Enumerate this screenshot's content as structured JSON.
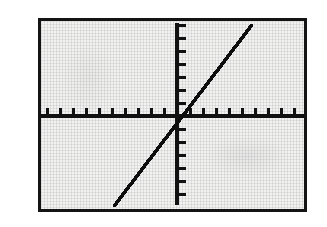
{
  "screen": {
    "device_label": "graphing-calculator-screen",
    "frame_color": "#141414",
    "lcd_background_color": "#f2f2f1",
    "ink_color": "#111111",
    "page_background_color": "#ffffff"
  },
  "chart_data": {
    "type": "line",
    "title": "",
    "subtitle": "",
    "xlabel": "",
    "ylabel": "",
    "grid": true,
    "legend": null,
    "legend_position": "none",
    "axes_style": "centered-crosshair-with-tick-marks",
    "tick_labels_visible": false,
    "x_tick_count_left_of_origin": 10,
    "x_tick_count_right_of_origin": 10,
    "y_tick_count_above_origin": 7,
    "y_tick_count_below_origin": 7,
    "xlim": [
      -10,
      10
    ],
    "ylim": [
      -7,
      7
    ],
    "x_tick_interval": 1,
    "y_tick_interval": 1,
    "origin": [
      0,
      0
    ],
    "series": [
      {
        "name": "y = x",
        "equation": "y = x",
        "slope": 1,
        "intercept": 0,
        "style": "solid",
        "x": [
          -5.2,
          -4,
          -3,
          -2,
          -1,
          0,
          1,
          2,
          3,
          4,
          5.4
        ],
        "values": [
          -5.2,
          -4,
          -3,
          -2,
          -1,
          0,
          1,
          2,
          3,
          4,
          5.4
        ],
        "x_start": -5.2,
        "x_end": 5.4,
        "y_start": -5.2,
        "y_end": 5.4
      }
    ],
    "annotations": []
  },
  "geometry": {
    "frame": {
      "left": 38,
      "top": 18,
      "width": 269,
      "height": 194,
      "border": 3
    },
    "plot": {
      "width": 263,
      "height": 188
    },
    "origin_px": {
      "x": 136,
      "y": 95
    },
    "tick_spacing_px": 13,
    "x_axis_thickness_px": 4,
    "y_axis_thickness_px": 4,
    "trace_start_px": {
      "x": 72,
      "y": 183
    },
    "trace_end_px": {
      "x": 209,
      "y": 3
    }
  }
}
